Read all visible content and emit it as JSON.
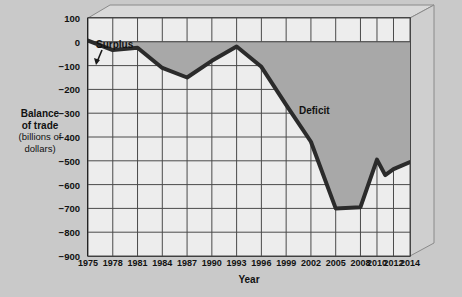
{
  "chart_data": {
    "type": "area",
    "title": "",
    "xlabel": "Year",
    "ylabel": "Balance of trade (billions of dollars)",
    "ylabel_lines": [
      "Balance",
      "of trade",
      "(billions of",
      "dollars)"
    ],
    "grid": true,
    "legend": "none",
    "xlim": [
      1975,
      2014
    ],
    "ylim": [
      -900,
      100
    ],
    "ytick_step": 100,
    "yticks": [
      100,
      0,
      -100,
      -200,
      -300,
      -400,
      -500,
      -600,
      -700,
      -800,
      -900
    ],
    "ytick_labels": [
      "100",
      "0",
      "−100",
      "−200",
      "−300",
      "−400",
      "−500",
      "−600",
      "−700",
      "−800",
      "−900"
    ],
    "xticks": [
      1975,
      1978,
      1981,
      1984,
      1987,
      1990,
      1993,
      1996,
      1999,
      2002,
      2005,
      2008,
      2010,
      2012,
      2014
    ],
    "xtick_labels": [
      "1975",
      "1978",
      "1981",
      "1984",
      "1987",
      "1990",
      "1993",
      "1996",
      "1999",
      "2002",
      "2005",
      "2008",
      "2010",
      "2012",
      "2014"
    ],
    "x": [
      1975,
      1978,
      1981,
      1984,
      1987,
      1990,
      1993,
      1996,
      1999,
      2002,
      2005,
      2008,
      2010,
      2011,
      2012,
      2014
    ],
    "values": [
      5,
      -35,
      -25,
      -110,
      -150,
      -80,
      -20,
      -105,
      -265,
      -420,
      -700,
      -695,
      -495,
      -560,
      -535,
      -505
    ],
    "series": [
      {
        "name": "Balance of trade",
        "values": [
          5,
          -35,
          -25,
          -110,
          -150,
          -80,
          -20,
          -105,
          -265,
          -420,
          -700,
          -695,
          -495,
          -560,
          -535,
          -505
        ]
      }
    ],
    "baseline": 0,
    "fill_description": "Gray shaded area between the zero line and the balance-of-trade curve, labeled Deficit",
    "annotations": [
      {
        "text": "Surplus",
        "x": 1976,
        "y": 95,
        "note": "leader arrow points down-left to the 1975 start of the curve"
      },
      {
        "text": "Deficit",
        "x": 2004,
        "y": -205,
        "note": "placed inside the shaded deficit region"
      }
    ],
    "colors": {
      "page_background": "#c9c9c9",
      "plot_background": "#ededed",
      "deficit_fill": "#a8a8a8",
      "line": "#2b2b2b",
      "grid": "#4a4a4a",
      "axis": "#1a1a1a",
      "frame_face": "#d4d4d4",
      "frame_edge": "#8c8c8c",
      "text": "#111111"
    }
  },
  "axis": {
    "y_title_line1": "Balance",
    "y_title_line2": "of trade",
    "y_title_line3": "(billions of",
    "y_title_line4": "dollars)",
    "x_title": "Year"
  },
  "annotations": {
    "surplus": "Surplus",
    "deficit": "Deficit"
  }
}
